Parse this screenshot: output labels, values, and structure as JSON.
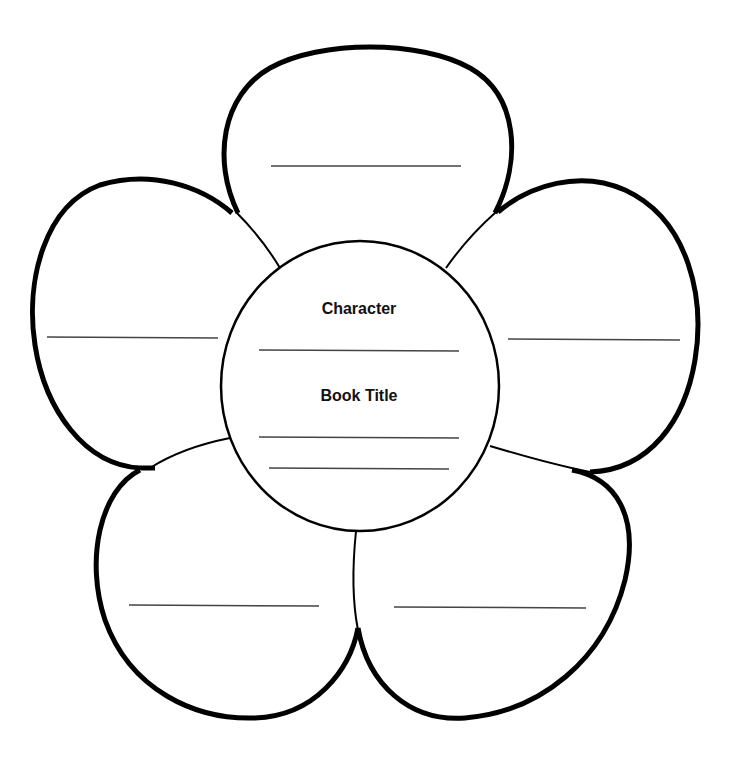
{
  "worksheet": {
    "type": "flower graphic organizer",
    "center": {
      "labels": [
        {
          "text": "Character"
        },
        {
          "text": "Book Title"
        }
      ],
      "blank_lines": 3
    },
    "petals": [
      {
        "position": "top",
        "blank_lines": 1
      },
      {
        "position": "left",
        "blank_lines": 1
      },
      {
        "position": "right",
        "blank_lines": 1
      },
      {
        "position": "bottom-left",
        "blank_lines": 1
      },
      {
        "position": "bottom-right",
        "blank_lines": 1
      }
    ],
    "colors": {
      "outline": "#000000",
      "writing_line": "#444444",
      "background": "#ffffff"
    }
  }
}
